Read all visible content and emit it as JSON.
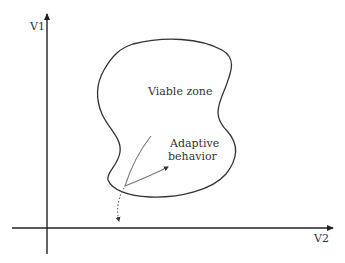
{
  "diagram": {
    "axes": {
      "y_label": "V1",
      "x_label": "V2"
    },
    "regions": [
      {
        "label": "Viable zone"
      }
    ],
    "annotations": [
      {
        "label_line1": "Adaptive",
        "label_line2": "behavior"
      }
    ],
    "colors": {
      "axis": "#222222",
      "boundary": "#333333",
      "trajectory": "#777777",
      "text": "#333333"
    }
  }
}
